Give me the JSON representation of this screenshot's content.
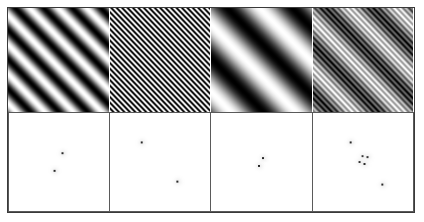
{
  "figure": {
    "title": "Sinusoidal gratings and their Fourier amplitude spectra",
    "width": 424,
    "height": 222,
    "background": "#ffffff",
    "border_color": "#3a3a3a",
    "rows": 2,
    "columns": 4,
    "row_labels": [
      "stimulus gratings",
      "fourier amplitude spectra"
    ]
  },
  "chart_data": {
    "type": "heatmap",
    "title": "Sinusoidal gratings and their Fourier amplitude spectra",
    "subtitle": "",
    "xlabel": "",
    "ylabel": "",
    "grid": false,
    "legend": "none",
    "layout": {
      "rows": 2,
      "cols": 4,
      "top_row": "spatial-domain luminance gratings (grayscale)",
      "bottom_row": "frequency-domain amplitude spectra (white background, dark peaks)"
    },
    "colormap": {
      "name": "grayscale",
      "low": "#000000",
      "high": "#ffffff"
    },
    "panels": [
      {
        "index": 0,
        "name": "grating-medium-frequency",
        "kind": "grating",
        "description": "medium spatial frequency diagonal sinusoid, bars oriented from lower-left to upper-right",
        "orientation_deg": 135,
        "cycles_across_patch": 5.0,
        "contrast": 1.0,
        "phase_deg": 0,
        "mean_luminance": 0.5
      },
      {
        "index": 1,
        "name": "grating-high-frequency",
        "kind": "grating",
        "description": "high spatial frequency fine diagonal sinusoid, dense narrow stripes",
        "orientation_deg": 135,
        "cycles_across_patch": 26.0,
        "contrast": 1.0,
        "phase_deg": 0,
        "mean_luminance": 0.5
      },
      {
        "index": 2,
        "name": "grating-low-frequency",
        "kind": "grating",
        "description": "low spatial frequency broad diagonal sinusoid, wide soft bars",
        "orientation_deg": 135,
        "cycles_across_patch": 2.2,
        "contrast": 1.0,
        "phase_deg": 0,
        "mean_luminance": 0.5
      },
      {
        "index": 3,
        "name": "grating-plaid-compound",
        "kind": "plaid",
        "description": "compound plaid: low-frequency grating summed with a high-frequency grating",
        "components": [
          {
            "orientation_deg": 135,
            "cycles_across_patch": 3.0,
            "contrast": 0.62
          },
          {
            "orientation_deg": 135,
            "cycles_across_patch": 24.0,
            "contrast": 0.38
          }
        ],
        "mean_luminance": 0.5
      }
    ],
    "spectra": [
      {
        "index": 0,
        "name": "spectrum-medium-frequency",
        "kind": "amplitude-spectrum",
        "background": "#ffffff",
        "dc_center": [
          0.5,
          0.5
        ],
        "peaks": [
          {
            "x": 0.46,
            "y": 0.59,
            "amplitude": 1.0,
            "label": "-f1"
          },
          {
            "x": 0.54,
            "y": 0.41,
            "amplitude": 1.0,
            "label": "+f1"
          }
        ]
      },
      {
        "index": 1,
        "name": "spectrum-high-frequency",
        "kind": "amplitude-spectrum",
        "background": "#ffffff",
        "dc_center": [
          0.5,
          0.5
        ],
        "peaks": [
          {
            "x": 0.32,
            "y": 0.3,
            "amplitude": 1.0,
            "label": "+f2"
          },
          {
            "x": 0.68,
            "y": 0.7,
            "amplitude": 1.0,
            "label": "-f2"
          }
        ]
      },
      {
        "index": 2,
        "name": "spectrum-low-frequency",
        "kind": "amplitude-spectrum",
        "background": "#ffffff",
        "dc_center": [
          0.5,
          0.5
        ],
        "peaks": [
          {
            "x": 0.48,
            "y": 0.54,
            "amplitude": 1.0,
            "label": "-f3"
          },
          {
            "x": 0.52,
            "y": 0.46,
            "amplitude": 1.0,
            "label": "+f3"
          }
        ]
      },
      {
        "index": 3,
        "name": "spectrum-plaid-compound",
        "kind": "amplitude-spectrum",
        "background": "#ffffff",
        "dc_center": [
          0.5,
          0.5
        ],
        "peaks": [
          {
            "x": 0.38,
            "y": 0.3,
            "amplitude": 1.0,
            "label": "+f_high"
          },
          {
            "x": 0.47,
            "y": 0.5,
            "amplitude": 0.9,
            "label": "+f_low"
          },
          {
            "x": 0.52,
            "y": 0.52,
            "amplitude": 0.9,
            "label": "-f_low"
          },
          {
            "x": 0.55,
            "y": 0.45,
            "amplitude": 0.8,
            "label": "sideband-a"
          },
          {
            "x": 0.5,
            "y": 0.44,
            "amplitude": 0.7,
            "label": "sideband-b"
          },
          {
            "x": 0.7,
            "y": 0.73,
            "amplitude": 1.0,
            "label": "-f_high"
          }
        ]
      }
    ]
  }
}
